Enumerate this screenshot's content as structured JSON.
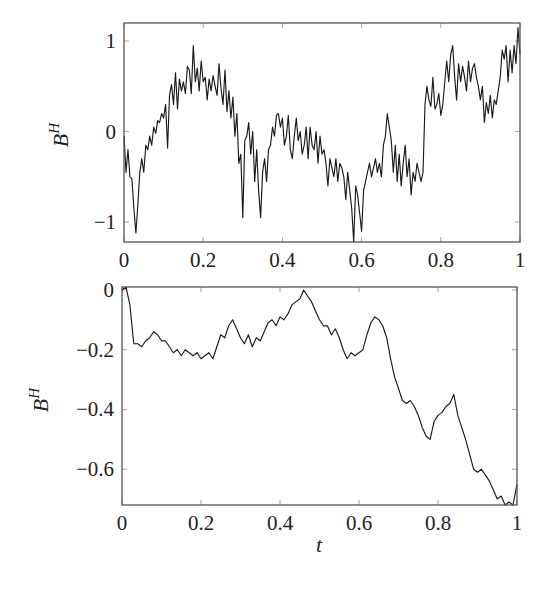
{
  "figure": {
    "panels": 2
  },
  "chart_data": [
    {
      "type": "line",
      "title": "",
      "xlabel": "",
      "ylabel": "B^H",
      "ylabel_base": "B",
      "ylabel_sup": "H",
      "xlim": [
        0,
        1
      ],
      "ylim": [
        -1.22,
        1.2
      ],
      "grid": false,
      "legend": null,
      "xticks": [
        0,
        0.2,
        0.4,
        0.6,
        0.8,
        1
      ],
      "xtick_labels": [
        "0",
        "0.2",
        "0.4",
        "0.6",
        "0.8",
        "1"
      ],
      "yticks": [
        -1,
        0,
        1
      ],
      "ytick_labels": [
        "−1",
        "0",
        "1"
      ],
      "series": [
        {
          "name": "B^H path (rough)",
          "color": "#1a1a1a",
          "x": [
            0,
            0.005,
            0.01,
            0.015,
            0.02,
            0.025,
            0.03,
            0.035,
            0.04,
            0.045,
            0.05,
            0.055,
            0.06,
            0.065,
            0.07,
            0.075,
            0.08,
            0.085,
            0.09,
            0.095,
            0.1,
            0.105,
            0.11,
            0.115,
            0.12,
            0.125,
            0.13,
            0.135,
            0.14,
            0.145,
            0.15,
            0.155,
            0.16,
            0.165,
            0.17,
            0.175,
            0.18,
            0.185,
            0.19,
            0.195,
            0.2,
            0.205,
            0.21,
            0.215,
            0.22,
            0.225,
            0.23,
            0.235,
            0.24,
            0.245,
            0.25,
            0.255,
            0.26,
            0.265,
            0.27,
            0.275,
            0.28,
            0.285,
            0.29,
            0.295,
            0.3,
            0.305,
            0.31,
            0.315,
            0.32,
            0.325,
            0.33,
            0.335,
            0.34,
            0.345,
            0.35,
            0.355,
            0.36,
            0.365,
            0.37,
            0.375,
            0.38,
            0.385,
            0.39,
            0.395,
            0.4,
            0.405,
            0.41,
            0.415,
            0.42,
            0.425,
            0.43,
            0.435,
            0.44,
            0.445,
            0.45,
            0.455,
            0.46,
            0.465,
            0.47,
            0.475,
            0.48,
            0.485,
            0.49,
            0.495,
            0.5,
            0.505,
            0.51,
            0.515,
            0.52,
            0.525,
            0.53,
            0.535,
            0.54,
            0.545,
            0.55,
            0.555,
            0.56,
            0.565,
            0.57,
            0.575,
            0.58,
            0.585,
            0.59,
            0.595,
            0.6,
            0.605,
            0.61,
            0.615,
            0.62,
            0.625,
            0.63,
            0.635,
            0.64,
            0.645,
            0.65,
            0.655,
            0.66,
            0.665,
            0.67,
            0.675,
            0.68,
            0.685,
            0.69,
            0.695,
            0.7,
            0.705,
            0.71,
            0.715,
            0.72,
            0.725,
            0.73,
            0.735,
            0.74,
            0.745,
            0.75,
            0.755,
            0.76,
            0.765,
            0.77,
            0.775,
            0.78,
            0.785,
            0.79,
            0.795,
            0.8,
            0.805,
            0.81,
            0.815,
            0.82,
            0.825,
            0.83,
            0.835,
            0.84,
            0.845,
            0.85,
            0.855,
            0.86,
            0.865,
            0.87,
            0.875,
            0.88,
            0.885,
            0.89,
            0.895,
            0.9,
            0.905,
            0.91,
            0.915,
            0.92,
            0.925,
            0.93,
            0.935,
            0.94,
            0.945,
            0.95,
            0.955,
            0.96,
            0.965,
            0.97,
            0.975,
            0.98,
            0.985,
            0.99,
            0.995,
            1.0
          ],
          "y": [
            -0.05,
            -0.45,
            -0.2,
            -0.5,
            -0.52,
            -0.85,
            -1.12,
            -0.8,
            -0.45,
            -0.3,
            -0.45,
            -0.15,
            -0.2,
            -0.05,
            -0.15,
            0.05,
            -0.02,
            0.12,
            0.1,
            0.2,
            0.15,
            0.3,
            -0.18,
            0.4,
            0.52,
            0.3,
            0.65,
            0.25,
            0.58,
            0.45,
            0.55,
            0.42,
            0.72,
            0.68,
            0.42,
            0.95,
            0.55,
            0.7,
            0.45,
            0.78,
            0.55,
            0.6,
            0.35,
            0.58,
            0.45,
            0.62,
            0.5,
            0.4,
            0.75,
            0.48,
            0.3,
            0.68,
            0.22,
            0.45,
            0.15,
            0.38,
            -0.05,
            0.2,
            -0.35,
            -0.25,
            -0.95,
            -0.1,
            -0.05,
            0.1,
            -0.25,
            0.0,
            -0.55,
            -0.2,
            -0.65,
            -0.95,
            -0.45,
            -0.3,
            -0.55,
            -0.2,
            -0.15,
            0.05,
            -0.05,
            0.18,
            0.2,
            0.05,
            0.15,
            -0.15,
            -0.05,
            0.18,
            -0.2,
            -0.3,
            -0.05,
            0.15,
            -0.1,
            0.0,
            -0.25,
            -0.15,
            0.05,
            -0.3,
            0.05,
            -0.15,
            -0.2,
            0.0,
            -0.35,
            -0.05,
            -0.25,
            -0.2,
            -0.35,
            -0.6,
            -0.3,
            -0.4,
            -0.5,
            -0.3,
            -0.55,
            -0.35,
            -0.4,
            -0.5,
            -0.75,
            -0.45,
            -0.65,
            -0.85,
            -1.22,
            -0.6,
            -0.7,
            -0.9,
            -1.1,
            -0.65,
            -0.55,
            -0.45,
            -0.35,
            -0.5,
            -0.4,
            -0.3,
            -0.45,
            -0.35,
            -0.5,
            -0.15,
            -0.05,
            0.2,
            0.05,
            -0.1,
            -0.45,
            -0.15,
            -0.55,
            -0.25,
            -0.6,
            -0.35,
            -0.15,
            -0.5,
            -0.3,
            -0.7,
            -0.45,
            -0.55,
            -0.35,
            -0.45,
            -0.55,
            -0.45,
            0.3,
            0.5,
            0.35,
            0.28,
            0.6,
            0.25,
            0.3,
            0.42,
            0.18,
            0.3,
            0.55,
            0.78,
            0.55,
            0.85,
            0.95,
            0.6,
            0.35,
            0.75,
            0.55,
            0.72,
            0.6,
            0.45,
            0.78,
            0.55,
            0.7,
            0.75,
            0.6,
            0.5,
            0.35,
            0.5,
            0.1,
            0.32,
            0.2,
            0.4,
            0.15,
            0.35,
            0.3,
            0.45,
            0.6,
            0.9,
            0.8,
            0.95,
            0.55,
            0.9,
            0.65,
            0.95,
            0.75,
            1.15,
            0.85,
            1.05,
            0.7,
            1.12
          ]
        }
      ]
    },
    {
      "type": "line",
      "title": "",
      "xlabel": "t",
      "ylabel": "B^H",
      "ylabel_base": "B",
      "ylabel_sup": "H",
      "xlim": [
        0,
        1
      ],
      "ylim": [
        -0.72,
        0.01
      ],
      "grid": false,
      "legend": null,
      "xticks": [
        0,
        0.2,
        0.4,
        0.6,
        0.8,
        1
      ],
      "xtick_labels": [
        "0",
        "0.2",
        "0.4",
        "0.6",
        "0.8",
        "1"
      ],
      "yticks": [
        -0.6,
        -0.4,
        -0.2,
        0
      ],
      "ytick_labels": [
        "−0.6",
        "−0.4",
        "−0.2",
        "0"
      ],
      "series": [
        {
          "name": "B^H path (smooth)",
          "color": "#1a1a1a",
          "x": [
            0,
            0.01,
            0.02,
            0.03,
            0.04,
            0.05,
            0.06,
            0.07,
            0.08,
            0.09,
            0.1,
            0.11,
            0.12,
            0.13,
            0.14,
            0.15,
            0.16,
            0.17,
            0.18,
            0.19,
            0.2,
            0.21,
            0.22,
            0.23,
            0.24,
            0.25,
            0.26,
            0.27,
            0.28,
            0.29,
            0.3,
            0.31,
            0.32,
            0.33,
            0.34,
            0.35,
            0.36,
            0.37,
            0.38,
            0.39,
            0.4,
            0.41,
            0.42,
            0.43,
            0.44,
            0.45,
            0.46,
            0.47,
            0.48,
            0.49,
            0.5,
            0.51,
            0.52,
            0.53,
            0.54,
            0.55,
            0.56,
            0.57,
            0.58,
            0.59,
            0.6,
            0.61,
            0.62,
            0.63,
            0.64,
            0.65,
            0.66,
            0.67,
            0.68,
            0.69,
            0.7,
            0.71,
            0.72,
            0.73,
            0.74,
            0.75,
            0.76,
            0.77,
            0.78,
            0.79,
            0.8,
            0.81,
            0.82,
            0.83,
            0.84,
            0.85,
            0.86,
            0.87,
            0.88,
            0.89,
            0.9,
            0.91,
            0.92,
            0.93,
            0.94,
            0.95,
            0.96,
            0.97,
            0.98,
            0.99,
            1.0
          ],
          "y": [
            0.0,
            0.01,
            -0.05,
            -0.18,
            -0.18,
            -0.19,
            -0.17,
            -0.16,
            -0.14,
            -0.15,
            -0.17,
            -0.17,
            -0.19,
            -0.21,
            -0.2,
            -0.22,
            -0.2,
            -0.21,
            -0.22,
            -0.21,
            -0.23,
            -0.22,
            -0.21,
            -0.23,
            -0.19,
            -0.15,
            -0.16,
            -0.12,
            -0.1,
            -0.13,
            -0.16,
            -0.18,
            -0.15,
            -0.19,
            -0.16,
            -0.17,
            -0.14,
            -0.11,
            -0.1,
            -0.12,
            -0.09,
            -0.1,
            -0.08,
            -0.05,
            -0.04,
            -0.03,
            0.0,
            -0.02,
            -0.04,
            -0.07,
            -0.1,
            -0.12,
            -0.12,
            -0.15,
            -0.13,
            -0.16,
            -0.2,
            -0.23,
            -0.21,
            -0.22,
            -0.21,
            -0.2,
            -0.15,
            -0.11,
            -0.09,
            -0.1,
            -0.12,
            -0.16,
            -0.23,
            -0.29,
            -0.33,
            -0.37,
            -0.38,
            -0.37,
            -0.39,
            -0.42,
            -0.46,
            -0.49,
            -0.5,
            -0.44,
            -0.42,
            -0.41,
            -0.39,
            -0.38,
            -0.35,
            -0.42,
            -0.46,
            -0.5,
            -0.55,
            -0.6,
            -0.61,
            -0.6,
            -0.62,
            -0.64,
            -0.67,
            -0.7,
            -0.69,
            -0.72,
            -0.71,
            -0.72,
            -0.65
          ]
        }
      ]
    }
  ]
}
